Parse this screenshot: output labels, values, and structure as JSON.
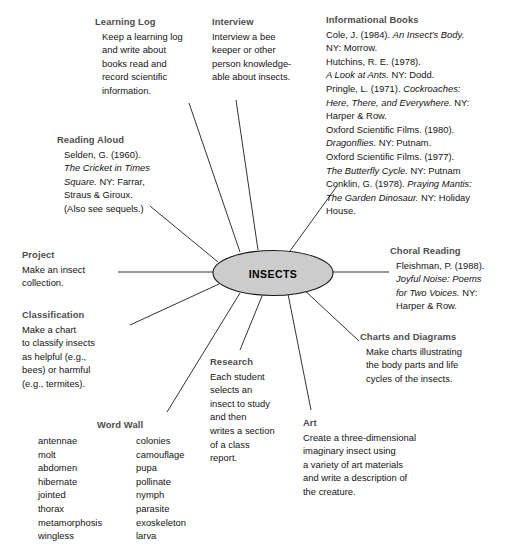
{
  "diagram": {
    "center": {
      "label": "INSECTS",
      "fill": "#cccccc",
      "stroke": "#1a1a1a"
    },
    "line_color": "#333333",
    "heading_color": "#4d4d4d"
  },
  "nodes": {
    "learning_log": {
      "heading": "Learning Log",
      "body": "Keep a learning log\nand write about\nbooks read and\nrecord scientific\ninformation."
    },
    "interview": {
      "heading": "Interview",
      "body": "Interview a bee\nkeeper or other\nperson knowledge-\nable about insects."
    },
    "informational_books": {
      "heading": "Informational Books",
      "entries": [
        {
          "plain1": "Cole, J. (1984). ",
          "italic": "An Insect's Body.",
          "plain2": ""
        },
        {
          "plain1": "NY: Morrow.",
          "italic": "",
          "plain2": ""
        },
        {
          "plain1": "Hutchins, R. E. (1978).",
          "italic": "",
          "plain2": ""
        },
        {
          "plain1": "",
          "italic": "A Look at Ants.",
          "plain2": " NY: Dodd."
        },
        {
          "plain1": "Pringle, L. (1971). ",
          "italic": "Cockroaches:",
          "plain2": ""
        },
        {
          "plain1": "",
          "italic": "Here, There, and Everywhere.",
          "plain2": " NY:"
        },
        {
          "plain1": "Harper & Row.",
          "italic": "",
          "plain2": ""
        },
        {
          "plain1": "Oxford Scientific Films. (1980).",
          "italic": "",
          "plain2": ""
        },
        {
          "plain1": "",
          "italic": "Dragonflies.",
          "plain2": " NY: Putnam."
        },
        {
          "plain1": "Oxford Scientific Films. (1977).",
          "italic": "",
          "plain2": ""
        },
        {
          "plain1": "",
          "italic": "The Butterfly Cycle.",
          "plain2": " NY: Putnam"
        },
        {
          "plain1": "Conklin, G. (1978). ",
          "italic": "Praying Mantis:",
          "plain2": ""
        },
        {
          "plain1": " ",
          "italic": "The Garden Dinosaur.",
          "plain2": " NY: Holiday"
        },
        {
          "plain1": "House.",
          "italic": "",
          "plain2": ""
        }
      ]
    },
    "reading_aloud": {
      "heading": "Reading Aloud",
      "entries": [
        {
          "plain1": "Selden, G. (1960).",
          "italic": "",
          "plain2": ""
        },
        {
          "plain1": "",
          "italic": "The Cricket in Times",
          "plain2": ""
        },
        {
          "plain1": "",
          "italic": "Square.",
          "plain2": " NY: Farrar,"
        },
        {
          "plain1": "Straus & Giroux.",
          "italic": "",
          "plain2": ""
        },
        {
          "plain1": "(Also see sequels.)",
          "italic": "",
          "plain2": ""
        }
      ]
    },
    "project": {
      "heading": "Project",
      "body": "Make an insect\ncollection."
    },
    "classification": {
      "heading": "Classification",
      "body": "Make a chart\nto classify insects\nas helpful (e.g.,\nbees) or harmful\n(e.g., termites)."
    },
    "choral_reading": {
      "heading": "Choral Reading",
      "entries": [
        {
          "plain1": "Fleishman, P. (1988).",
          "italic": "",
          "plain2": ""
        },
        {
          "plain1": "",
          "italic": "Joyful Noise: Poems",
          "plain2": ""
        },
        {
          "plain1": "",
          "italic": "for Two Voices.",
          "plain2": " NY:"
        },
        {
          "plain1": "Harper & Row.",
          "italic": "",
          "plain2": ""
        }
      ]
    },
    "charts_and_diagrams": {
      "heading": "Charts and Diagrams",
      "body": "Make charts illustrating\nthe body parts and life\ncycles of the insects."
    },
    "research": {
      "heading": "Research",
      "body": "Each student\nselects an\ninsect to study\nand then\nwrites a section\nof a class\nreport."
    },
    "art": {
      "heading": "Art",
      "body": "Create a three-dimensional\nimaginary insect using\na variety of art materials\nand write a description of\nthe creature."
    },
    "word_wall": {
      "heading": "Word Wall",
      "column_left": [
        "antennae",
        "molt",
        "abdomen",
        "hibernate",
        "jointed",
        "thorax",
        "metamorphosis",
        "wingless"
      ],
      "column_right": [
        "colonies",
        "camouflage",
        "pupa",
        "pollinate",
        "nymph",
        "parasite",
        "exoskeleton",
        "larva"
      ]
    }
  }
}
